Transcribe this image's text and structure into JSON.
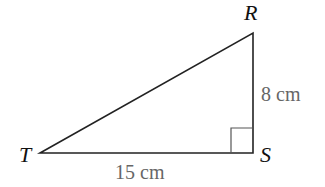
{
  "diagram": {
    "type": "right-triangle",
    "vertices": {
      "T": {
        "label": "T",
        "x": 40,
        "y": 153
      },
      "S": {
        "label": "S",
        "x": 253,
        "y": 153
      },
      "R": {
        "label": "R",
        "x": 253,
        "y": 33
      }
    },
    "sides": {
      "TS": {
        "label": "15 cm"
      },
      "RS": {
        "label": "8 cm"
      }
    },
    "right_angle_at": "S",
    "colors": {
      "line": "#222222",
      "vertex_label": "#111111",
      "measure_label": "#666666",
      "right_angle_marker": "#555555"
    }
  }
}
